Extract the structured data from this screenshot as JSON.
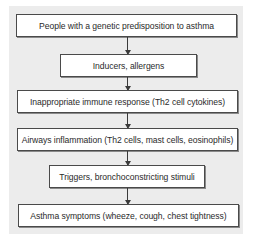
{
  "diagram": {
    "type": "flowchart",
    "direction": "top-to-bottom",
    "colors": {
      "panel_background": "#ececec",
      "box_fill": "#ffffff",
      "box_border": "#4a4a4a",
      "arrow": "#3a3a3a",
      "text": "#2a2a2a"
    },
    "nodes": [
      {
        "id": 1,
        "label": "People with a genetic predisposition to asthma"
      },
      {
        "id": 2,
        "label": "Inducers, allergens"
      },
      {
        "id": 3,
        "label": "Inappropriate immune response (Th2 cell cytokines)"
      },
      {
        "id": 4,
        "label": "Airways inflammation (Th2 cells, mast cells, eosinophils)"
      },
      {
        "id": 5,
        "label": "Triggers, bronchoconstricting stimuli"
      },
      {
        "id": 6,
        "label": "Asthma symptoms (wheeze, cough, chest tightness)"
      }
    ],
    "edges": [
      {
        "from": 1,
        "to": 2
      },
      {
        "from": 2,
        "to": 3
      },
      {
        "from": 3,
        "to": 4
      },
      {
        "from": 4,
        "to": 5
      },
      {
        "from": 5,
        "to": 6
      }
    ]
  }
}
